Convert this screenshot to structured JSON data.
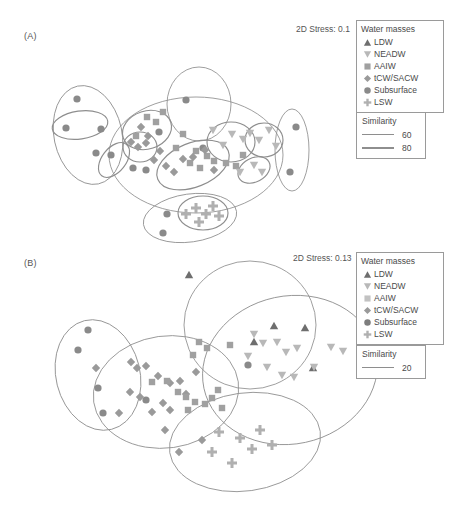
{
  "figure": {
    "type": "nmds-ordination",
    "panels": [
      {
        "id": "A",
        "label": "(A)",
        "stress_label": "2D Stress: 0.1"
      },
      {
        "id": "B",
        "label": "(B)",
        "stress_label": "2D Stress: 0.13"
      }
    ]
  },
  "legend": {
    "water_masses_title": "Water masses",
    "items": [
      {
        "label": "LDW",
        "symbol": "triangle-up",
        "color": "#6e6e6e"
      },
      {
        "label": "NEADW",
        "symbol": "triangle-down",
        "color": "#b8b8b8"
      },
      {
        "label": "AAIW",
        "symbol": "square",
        "color": "#a0a0a0"
      },
      {
        "label": "tCW/SACW",
        "symbol": "diamond",
        "color": "#9a9a9a"
      },
      {
        "label": "Subsurface",
        "symbol": "circle",
        "color": "#8a8a8a"
      },
      {
        "label": "LSW",
        "symbol": "cross",
        "color": "#b0b0b0"
      }
    ],
    "similarity_title": "Similarity",
    "similarity_a": [
      {
        "value": "60",
        "weight": "thin"
      },
      {
        "value": "80",
        "weight": "thick"
      }
    ],
    "similarity_b": [
      {
        "value": "20",
        "weight": "thin"
      }
    ]
  },
  "colors": {
    "ellipse_stroke": "#8e8e8e",
    "text": "#4a4a4a",
    "ldw": "#6e6e6e",
    "neadw": "#b8b8b8",
    "aaiw": "#a0a0a0",
    "tcw_sacw": "#9a9a9a",
    "subsurface": "#8a8a8a",
    "lsw": "#b0b0b0"
  },
  "chart_data": {
    "type": "scatter",
    "title": "",
    "xlabel": "",
    "ylabel": "",
    "grid": false,
    "axes_visible": false,
    "legend_position": "top-right",
    "panels": [
      {
        "id": "A",
        "stress": 0.1,
        "similarity_contours": [
          60,
          80
        ],
        "series": [
          {
            "name": "Subsurface",
            "symbol": "circle",
            "color": "#8a8a8a",
            "points": [
              [
                77,
                99
              ],
              [
                66,
                128
              ],
              [
                101,
                129
              ],
              [
                111,
                155
              ],
              [
                133,
                168
              ],
              [
                186,
                100
              ],
              [
                96,
                153
              ],
              [
                159,
                132
              ],
              [
                296,
                127
              ],
              [
                290,
                172
              ],
              [
                167,
                214
              ],
              [
                163,
                233
              ],
              [
                146,
                170
              ],
              [
                203,
                148
              ]
            ]
          },
          {
            "name": "AAIW",
            "symbol": "square",
            "color": "#a0a0a0",
            "points": [
              [
                147,
                117
              ],
              [
                156,
                122
              ],
              [
                136,
                136
              ],
              [
                183,
                134
              ],
              [
                176,
                148
              ],
              [
                196,
                151
              ],
              [
                207,
                156
              ],
              [
                214,
                161
              ],
              [
                226,
                163
              ],
              [
                236,
                166
              ],
              [
                243,
                155
              ],
              [
                190,
                163
              ],
              [
                200,
                168
              ],
              [
                163,
                112
              ]
            ]
          },
          {
            "name": "tCW/SACW",
            "symbol": "diamond",
            "color": "#9a9a9a",
            "points": [
              [
                141,
                127
              ],
              [
                131,
                142
              ],
              [
                138,
                147
              ],
              [
                146,
                143
              ],
              [
                154,
                160
              ],
              [
                166,
                166
              ],
              [
                174,
                172
              ],
              [
                183,
                159
              ],
              [
                193,
                157
              ],
              [
                205,
                150
              ],
              [
                214,
                170
              ],
              [
                148,
                136
              ],
              [
                160,
                151
              ]
            ]
          },
          {
            "name": "NEADW",
            "symbol": "triangle-down",
            "color": "#b8b8b8",
            "points": [
              [
                213,
                130
              ],
              [
                223,
                145
              ],
              [
                232,
                134
              ],
              [
                243,
                139
              ],
              [
                250,
                133
              ],
              [
                259,
                140
              ],
              [
                269,
                130
              ],
              [
                276,
                146
              ],
              [
                254,
                165
              ],
              [
                262,
                172
              ],
              [
                240,
                172
              ]
            ]
          },
          {
            "name": "LSW",
            "symbol": "cross",
            "color": "#b0b0b0",
            "points": [
              [
                186,
                214
              ],
              [
                196,
                208
              ],
              [
                206,
                214
              ],
              [
                213,
                206
              ],
              [
                219,
                216
              ],
              [
                199,
                222
              ]
            ]
          }
        ],
        "ellipses": [
          {
            "cx": 88,
            "cy": 135,
            "rx": 34,
            "ry": 50,
            "rot": -12,
            "level": 60
          },
          {
            "cx": 80,
            "cy": 125,
            "rx": 28,
            "ry": 14,
            "rot": -8,
            "level": 80
          },
          {
            "cx": 114,
            "cy": 160,
            "rx": 20,
            "ry": 12,
            "rot": -52,
            "level": 80
          },
          {
            "cx": 196,
            "cy": 155,
            "rx": 87,
            "ry": 58,
            "rot": 0,
            "level": 60
          },
          {
            "cx": 147,
            "cy": 130,
            "rx": 25,
            "ry": 19,
            "rot": -18,
            "level": 80
          },
          {
            "cx": 140,
            "cy": 147,
            "rx": 17,
            "ry": 15,
            "rot": 0,
            "level": 80
          },
          {
            "cx": 193,
            "cy": 165,
            "rx": 38,
            "ry": 22,
            "rot": -22,
            "level": 80
          },
          {
            "cx": 231,
            "cy": 142,
            "rx": 24,
            "ry": 20,
            "rot": 0,
            "level": 80
          },
          {
            "cx": 264,
            "cy": 140,
            "rx": 19,
            "ry": 17,
            "rot": 0,
            "level": 80
          },
          {
            "cx": 254,
            "cy": 170,
            "rx": 17,
            "ry": 12,
            "rot": -28,
            "level": 80
          },
          {
            "cx": 199,
            "cy": 104,
            "rx": 32,
            "ry": 37,
            "rot": 0,
            "level": 60
          },
          {
            "cx": 292,
            "cy": 150,
            "rx": 17,
            "ry": 41,
            "rot": 0,
            "level": 60
          },
          {
            "cx": 190,
            "cy": 218,
            "rx": 47,
            "ry": 24,
            "rot": -8,
            "level": 60
          },
          {
            "cx": 203,
            "cy": 213,
            "rx": 25,
            "ry": 17,
            "rot": 0,
            "level": 80
          }
        ]
      },
      {
        "id": "B",
        "stress": 0.13,
        "similarity_contours": [
          20
        ],
        "series": [
          {
            "name": "Subsurface",
            "symbol": "circle",
            "color": "#8a8a8a",
            "points": [
              [
                88,
                330
              ],
              [
                78,
                350
              ],
              [
                98,
                388
              ],
              [
                146,
                400
              ],
              [
                103,
                413
              ],
              [
                248,
                365
              ]
            ]
          },
          {
            "name": "tCW/SACW",
            "symbol": "diamond",
            "color": "#9a9a9a",
            "points": [
              [
                96,
                368
              ],
              [
                131,
                362
              ],
              [
                137,
                368
              ],
              [
                146,
                366
              ],
              [
                158,
                376
              ],
              [
                170,
                383
              ],
              [
                180,
                381
              ],
              [
                130,
                392
              ],
              [
                140,
                397
              ],
              [
                163,
                403
              ],
              [
                186,
                394
              ],
              [
                196,
                372
              ],
              [
                152,
                412
              ],
              [
                165,
                430
              ],
              [
                179,
                452
              ],
              [
                202,
                440
              ],
              [
                119,
                413
              ],
              [
                170,
                410
              ]
            ]
          },
          {
            "name": "AAIW",
            "symbol": "square",
            "color": "#a0a0a0",
            "points": [
              [
                152,
                382
              ],
              [
                167,
                381
              ],
              [
                178,
                392
              ],
              [
                186,
                397
              ],
              [
                195,
                402
              ],
              [
                205,
                404
              ],
              [
                212,
                398
              ],
              [
                218,
                390
              ],
              [
                199,
                342
              ],
              [
                207,
                348
              ],
              [
                193,
                355
              ],
              [
                222,
                408
              ],
              [
                230,
                345
              ],
              [
                188,
                410
              ]
            ]
          },
          {
            "name": "LDW",
            "symbol": "triangle-up",
            "color": "#6e6e6e",
            "points": [
              [
                189,
                275
              ],
              [
                274,
                326
              ],
              [
                305,
                328
              ],
              [
                313,
                368
              ],
              [
                254,
                342
              ]
            ]
          },
          {
            "name": "NEADW",
            "symbol": "triangle-down",
            "color": "#b8b8b8",
            "points": [
              [
                254,
                334
              ],
              [
                263,
                343
              ],
              [
                277,
                342
              ],
              [
                286,
                352
              ],
              [
                297,
                348
              ],
              [
                331,
                347
              ],
              [
                343,
                351
              ],
              [
                282,
                375
              ],
              [
                294,
                377
              ],
              [
                314,
                367
              ],
              [
                267,
                367
              ],
              [
                248,
                356
              ]
            ]
          },
          {
            "name": "LSW",
            "symbol": "cross",
            "color": "#b0b0b0",
            "points": [
              [
                219,
                432
              ],
              [
                240,
                438
              ],
              [
                260,
                430
              ],
              [
                212,
                452
              ],
              [
                232,
                463
              ],
              [
                252,
                449
              ],
              [
                272,
                445
              ]
            ]
          }
        ],
        "ellipses": [
          {
            "cx": 98,
            "cy": 375,
            "rx": 42,
            "ry": 56,
            "rot": -14,
            "level": 20
          },
          {
            "cx": 166,
            "cy": 392,
            "rx": 73,
            "ry": 56,
            "rot": -8,
            "level": 20
          },
          {
            "cx": 250,
            "cy": 325,
            "rx": 66,
            "ry": 64,
            "rot": 0,
            "level": 20
          },
          {
            "cx": 290,
            "cy": 370,
            "rx": 88,
            "ry": 74,
            "rot": -12,
            "level": 20
          },
          {
            "cx": 245,
            "cy": 442,
            "rx": 76,
            "ry": 49,
            "rot": -8,
            "level": 20
          }
        ]
      }
    ]
  }
}
